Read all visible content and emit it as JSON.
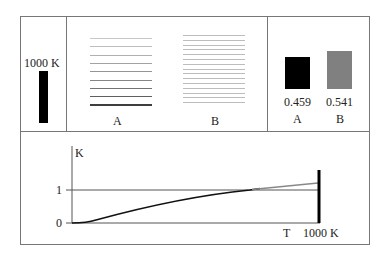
{
  "panel_source": {
    "label": "1000 K",
    "bar_color": "#000000"
  },
  "panel_spectra": {
    "A": {
      "label": "A",
      "line_count": 9,
      "line_colors": [
        "#c8c8c8",
        "#bdbdbd",
        "#b0b0b0",
        "#a3a3a3",
        "#959595",
        "#868686",
        "#747474",
        "#5f5f5f",
        "#3e3e3e"
      ]
    },
    "B": {
      "label": "B",
      "line_count": 15,
      "line_color": "#bdbdbd"
    }
  },
  "panel_fractions": {
    "A": {
      "label": "A",
      "value": "0.459",
      "color": "#000000"
    },
    "B": {
      "label": "B",
      "value": "0.541",
      "color": "#808080"
    }
  },
  "graph": {
    "y_axis_label": "K",
    "y_tick_1": "1",
    "y_tick_0": "0",
    "x_label_T": "T",
    "x_label_end": "1000 K"
  }
}
